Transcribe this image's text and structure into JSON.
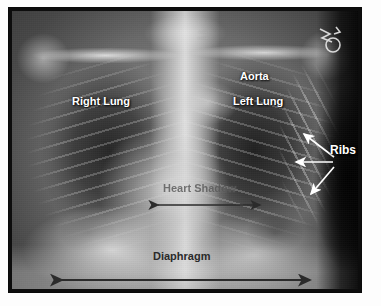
{
  "image": {
    "kind": "chest-xray-radiograph",
    "view": "posteroanterior",
    "frame_color": "#0d0d0d",
    "page_background": "#ffffff"
  },
  "labels": {
    "right_lung": "Right Lung",
    "left_lung": "Left Lung",
    "aorta": "Aorta",
    "ribs": "Ribs",
    "heart_shadow": "Heart Shadow",
    "diaphragm": "Diaphragm"
  },
  "label_colors": {
    "anatomy_white": "#ffffff",
    "anatomy_dark": "#2a2a2a",
    "heart_shadow_faint": "#5a5a5a"
  },
  "annotations": {
    "rib_arrows": {
      "count": 3,
      "color": "#ffffff",
      "description": "three white single-headed arrows fanning left from the Ribs label toward the lateral rib cage"
    },
    "heart_shadow_arrow": {
      "type": "double-headed",
      "color": "#2b2b2b",
      "description": "horizontal double-headed arrow spanning the cardiac silhouette width"
    },
    "diaphragm_arrow": {
      "type": "double-headed",
      "color": "#2b2b2b",
      "description": "horizontal double-headed arrow spanning the full diaphragm width"
    }
  },
  "film_markings": {
    "stamp_text_line1": "▫▫▫▫",
    "stamp_text_line2": "▫▫▫▫▫",
    "corner_marker": "radiopaque side marker"
  }
}
